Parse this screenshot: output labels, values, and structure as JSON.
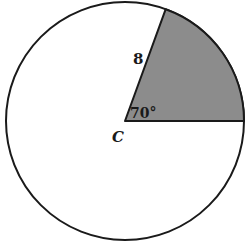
{
  "diagram": {
    "type": "circle-sector",
    "center_label": "C",
    "radius_label": "8",
    "angle_label": "70°",
    "colors": {
      "stroke": "#1a1a1a",
      "sector_fill": "#8c8c8c",
      "background": "#ffffff"
    }
  }
}
